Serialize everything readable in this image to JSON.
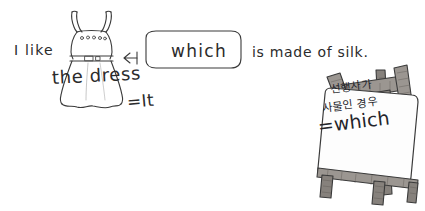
{
  "scene": {
    "title": "Relative pronoun 'which' grammar illustration",
    "background_color": "#ffffff",
    "ink_color": "#3b3b3b"
  },
  "sentence": {
    "part_1": "I like",
    "part_2": "the dress",
    "part_2_equivalent": "=It",
    "bubble_word": "which",
    "part_3": "is made of silk."
  },
  "speech_bubble": {
    "word": "which",
    "arrow_direction": "left",
    "arrow_points_to": "the-dress",
    "shape": "rounded-rectangle"
  },
  "dress_illustration": {
    "name": "sleeveless-dress",
    "button_count": 5,
    "has_belt": true,
    "has_buckle": true,
    "has_straps": true
  },
  "easel": {
    "name": "wooden-easel",
    "leg_count": 3,
    "wood_color": "#9b9691",
    "board_color": "#fdfdfd",
    "board": {
      "line_1": "선행사가",
      "line_2": "사물인 경우",
      "line_3": "=which"
    }
  }
}
